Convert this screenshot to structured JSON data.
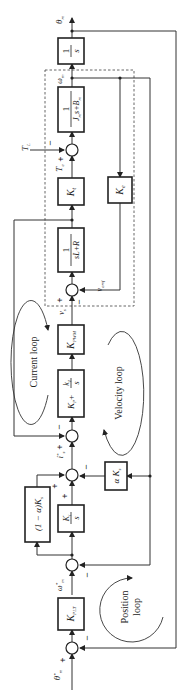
{
  "diagram": {
    "title": "",
    "orientation": "rotated-90-ccw",
    "signals": {
      "theta_m": "θ",
      "theta_m_sub": "m",
      "theta_ref": "θ",
      "theta_ref_sup": "*",
      "theta_ref_sub": "m",
      "omega_m": "ω",
      "omega_m_sub": "m",
      "omega_ref": "ω",
      "omega_ref_sup": "*",
      "omega_ref_sub": "m",
      "T_L": "T",
      "T_L_sub": "L",
      "T_e": "T",
      "T_e_sub": "e",
      "v_s": "v",
      "v_s_sub": "s",
      "v_emf": "v",
      "v_emf_sub": "emf",
      "i_ref": "i",
      "i_ref_sup": "*",
      "i_ref_sub": "s"
    },
    "blocks": {
      "integrator_pos": {
        "num": "1",
        "den": "s"
      },
      "mech_plant": {
        "num": "1",
        "den": "J",
        "den_sub1": "m",
        "den_mid": "s+B",
        "den_sub2": "m"
      },
      "torque_const": {
        "label": "K",
        "sub": "t"
      },
      "back_emf_const": {
        "label": "K",
        "sub": "e"
      },
      "elec_plant": {
        "num": "1",
        "den": "sL+R"
      },
      "pwm_gain": {
        "label": "K",
        "sub": "PWM"
      },
      "current_pi": {
        "p": "K",
        "p_sub": "P",
        "plus": "+",
        "i_num": "k",
        "i_num_sub": "I",
        "i_den": "s"
      },
      "vel_integral": {
        "num": "K",
        "num_sub": "i",
        "den": "s"
      },
      "vel_ff": {
        "label": "(1 − α)K",
        "sub": "s"
      },
      "vel_fb": {
        "label": "α K",
        "sub": "s"
      },
      "pos_gain": {
        "label": "K",
        "sub": "PLT"
      }
    },
    "signs": {
      "plus": "+",
      "minus": "−"
    },
    "loops": {
      "current": "Current loop",
      "velocity": "Velocity loop",
      "position_line1": "Position",
      "position_line2": "loop"
    }
  }
}
